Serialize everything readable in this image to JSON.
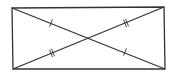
{
  "diagram": {
    "type": "geometry",
    "colors": {
      "stroke": "#333333",
      "background": "#ffffff"
    },
    "stroke_width": 1.3,
    "rectangle": {
      "corners": {
        "top_left": [
          12,
          8
        ],
        "top_right": [
          164,
          7
        ],
        "bottom_right": [
          165,
          69
        ],
        "bottom_left": [
          13,
          69
        ]
      }
    },
    "diagonals": [
      {
        "id": "diagonal-tl-br",
        "from": [
          12,
          8
        ],
        "to": [
          165,
          69
        ],
        "tick_count": 1
      },
      {
        "id": "diagonal-bl-tr",
        "from": [
          13,
          69
        ],
        "to": [
          164,
          7
        ],
        "tick_count": 2
      }
    ],
    "intersection": [
      88,
      38
    ],
    "tick_marks": [
      {
        "diagonal": "diagonal-tl-br",
        "position": [
          51,
          23
        ],
        "count": 1
      },
      {
        "diagonal": "diagonal-tl-br",
        "position": [
          125,
          52
        ],
        "count": 1
      },
      {
        "diagonal": "diagonal-bl-tr",
        "position": [
          52,
          53
        ],
        "count": 2
      },
      {
        "diagonal": "diagonal-bl-tr",
        "position": [
          126,
          23
        ],
        "count": 2
      }
    ]
  }
}
